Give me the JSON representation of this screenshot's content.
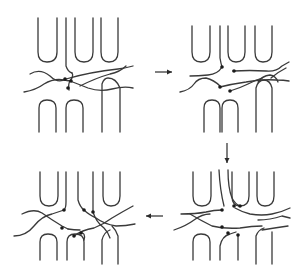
{
  "figure": {
    "width": 303,
    "height": 278,
    "stroke_color": "#3a3a3a",
    "dot_color": "#1a1a1a",
    "background": "#ffffff"
  },
  "arrows": [
    {
      "name": "arrow-right",
      "direction": "right",
      "x1": 155,
      "y1": 72,
      "x2": 172,
      "y2": 72
    },
    {
      "name": "arrow-down",
      "direction": "down",
      "x1": 227,
      "y1": 143,
      "x2": 227,
      "y2": 163
    },
    {
      "name": "arrow-left",
      "direction": "left",
      "x1": 163,
      "y1": 216,
      "x2": 146,
      "y2": 216
    }
  ],
  "panels": [
    {
      "name": "panel-top-left",
      "position": "top-left",
      "paths": [
        "M38 18 L38 52 Q38 62 47 62 Q57 62 57 52 L57 18",
        "M75 18 L75 52 Q75 62 84 62 Q93 62 93 52 L93 18",
        "M101 18 L101 52 Q101 62 109 62 Q118 62 118 52 L118 18",
        "M66 18 L66 66 Q68 72 72 73",
        "M30 74 Q40 68 50 76 Q58 84 66 79 Q90 72 118 69 Q126 68 133 66",
        "M24 92 Q36 90 44 84 Q54 78 64 80 L70 81 Q78 84 88 88 Q100 92 112 89 Q124 86 133 88",
        "M70 81 Q74 76 72 73",
        "M69 90 Q68 84 70 81",
        "M80 86 Q96 78 110 74 Q120 72 126 66",
        "M39 132 L39 108 Q39 100 47 100 Q56 100 56 108 L56 132",
        "M66 132 L66 108 Q66 100 74 100 Q83 100 83 108 L83 132",
        "M102 132 L102 84 Q104 78 108 78 Q116 78 120 88 L120 132"
      ],
      "dots": [
        {
          "x": 65,
          "y": 79
        },
        {
          "x": 71,
          "y": 81
        },
        {
          "x": 68,
          "y": 88
        }
      ]
    },
    {
      "name": "panel-top-right",
      "position": "top-right",
      "paths": [
        "M192 26 L192 52 Q192 62 201 62 Q210 62 210 52 L210 26",
        "M228 26 L228 52 Q228 62 236 62 Q245 62 245 52 L245 26",
        "M255 26 L255 52 Q255 62 263 62 Q272 62 272 52 L272 26",
        "M220 26 L220 58 Q221 64 222 67",
        "M222 67 Q218 74 208 75 Q198 76 190 76",
        "M180 92 Q190 90 194 84 Q198 78 206 78 Q214 80 220 86 L220 87",
        "M220 87 Q232 84 246 82 Q262 79 276 80 Q284 80 289 81",
        "M233 71 Q250 70 266 71 Q276 72 282 66 L289 62",
        "M271 78 Q278 72 286 68",
        "M230 91 Q240 88 248 84 Q256 80 262 78",
        "M258 82 Q262 76 270 75 Q276 76 278 82",
        "M204 132 L204 108 Q204 100 212 100 Q220 100 220 108 L220 132",
        "M222 132 L222 108 Q222 100 230 100 Q238 100 238 108 L238 132",
        "M256 132 L256 88 Q258 80 264 80 Q270 80 272 88 L272 132"
      ],
      "dots": [
        {
          "x": 222,
          "y": 67
        },
        {
          "x": 234,
          "y": 71
        },
        {
          "x": 220,
          "y": 87
        },
        {
          "x": 230,
          "y": 91
        }
      ]
    },
    {
      "name": "panel-bottom-left",
      "position": "bottom-left",
      "paths": [
        "M40 172 L40 196 Q40 206 49 206 Q58 206 58 196 L58 172",
        "M103 172 L103 196 Q103 206 111 206 Q120 206 120 196 L120 172",
        "M66 172 L66 202 Q66 208 64 210",
        "M78 172 L78 200 Q80 207 84 210",
        "M93 172 L93 212",
        "M22 214 Q34 208 42 213 Q52 220 62 226 L68 229",
        "M14 236 Q26 236 34 226 Q42 216 52 214 Q58 212 64 210",
        "M84 210 Q88 214 96 218 Q104 224 116 226 Q126 226 135 224",
        "M93 212 Q96 222 104 228 Q108 232 110 238",
        "M68 229 Q74 230 80 230",
        "M74 236 Q82 230 94 228 Q104 224 112 218 Q122 212 133 206",
        "M40 260 L40 242 Q40 234 48 234 Q57 234 57 242 L57 260",
        "M67 260 L67 242 Q67 234 75 234 Q84 234 84 242 L84 260",
        "M102 264 L102 240 Q104 232 110 230",
        "M118 264 L118 236 Q116 230 112 226",
        "M80 233 Q86 232 84 240"
      ],
      "dots": [
        {
          "x": 64,
          "y": 210
        },
        {
          "x": 84,
          "y": 210
        },
        {
          "x": 93,
          "y": 212
        },
        {
          "x": 62,
          "y": 228
        },
        {
          "x": 74,
          "y": 236
        },
        {
          "x": 81,
          "y": 233
        }
      ]
    },
    {
      "name": "panel-bottom-right",
      "position": "bottom-right",
      "paths": [
        "M193 172 L193 196 Q193 206 202 206 Q211 206 211 196 L211 172",
        "M232 172 L232 196 Q232 206 240 206 Q249 206 249 196 L249 172",
        "M257 172 L257 196 Q257 206 265 206 Q274 206 274 196 L274 172",
        "M219 170 Q220 190 224 206",
        "M228 170 Q228 188 232 198 Q235 204 240 206",
        "M181 214 Q196 214 206 212 Q214 210 222 210",
        "M174 230 Q186 226 194 220 Q202 214 210 214",
        "M190 214 Q200 220 212 226 Q224 229 240 228 Q252 226 262 226",
        "M235 208 Q242 212 250 214 Q262 216 272 214 Q282 212 290 208",
        "M258 220 Q270 220 282 216 L290 218",
        "M262 230 Q274 228 288 226",
        "M193 260 L193 242 Q193 234 201 234 Q210 234 210 242 L210 260",
        "M220 260 L220 246 Q222 236 230 234 L236 232",
        "M238 260 L238 236",
        "M256 264 L256 236 Q258 230 264 228",
        "M272 264 L272 232"
      ],
      "dots": [
        {
          "x": 222,
          "y": 210
        },
        {
          "x": 234,
          "y": 206
        },
        {
          "x": 240,
          "y": 206
        },
        {
          "x": 222,
          "y": 227
        },
        {
          "x": 228,
          "y": 233
        },
        {
          "x": 238,
          "y": 235
        }
      ]
    }
  ]
}
